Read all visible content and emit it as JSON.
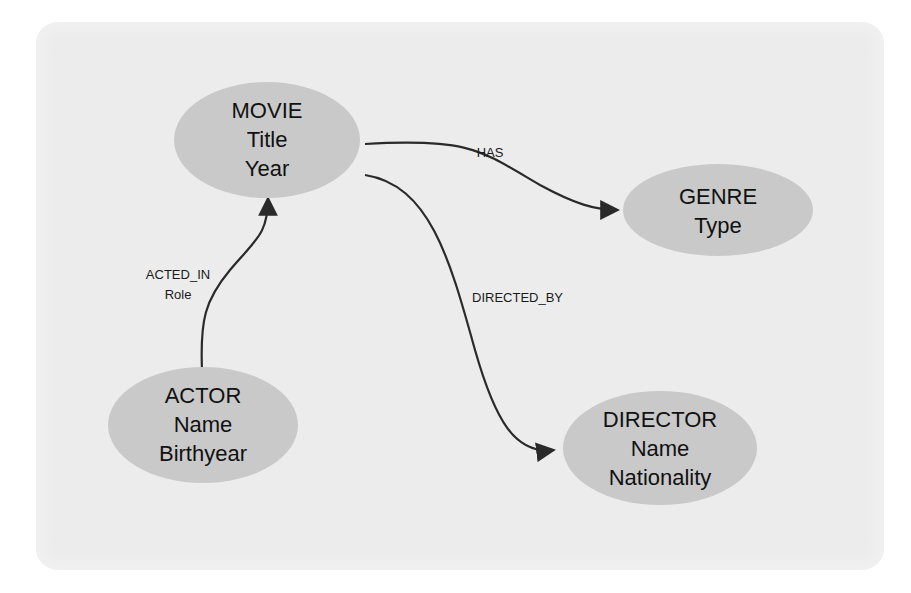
{
  "diagram": {
    "type": "entity-relationship graph",
    "colors": {
      "background_panel": "#ececec",
      "node_fill": "#c9c9c9",
      "edge_stroke": "#2a2a2a",
      "text": "#111111"
    },
    "nodes": {
      "movie": {
        "title": "MOVIE",
        "attrs": [
          "Title",
          "Year"
        ]
      },
      "genre": {
        "title": "GENRE",
        "attrs": [
          "Type"
        ]
      },
      "actor": {
        "title": "ACTOR",
        "attrs": [
          "Name",
          "Birthyear"
        ]
      },
      "director": {
        "title": "DIRECTOR",
        "attrs": [
          "Name",
          "Nationality"
        ]
      }
    },
    "edges": {
      "has": {
        "label": "HAS",
        "from": "MOVIE",
        "to": "GENRE"
      },
      "directed_by": {
        "label": "DIRECTED_BY",
        "from": "MOVIE",
        "to": "DIRECTOR"
      },
      "acted_in": {
        "label": "ACTED_IN",
        "property": "Role",
        "from": "ACTOR",
        "to": "MOVIE"
      }
    }
  }
}
